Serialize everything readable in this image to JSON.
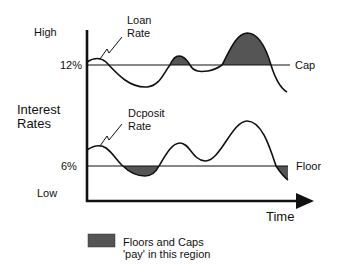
{
  "diagram": {
    "title": "",
    "y_axis": {
      "label_line1": "Interest",
      "label_line2": "Rates",
      "high": "High",
      "low": "Low",
      "tick_12": "12%",
      "tick_6": "6%"
    },
    "x_axis": {
      "label": "Time"
    },
    "lines": {
      "cap": "Cap",
      "floor": "Floor"
    },
    "curves": {
      "loan_line1": "Loan",
      "loan_line2": "Rate",
      "deposit_line1": "Dcposit",
      "deposit_line2": "Rate"
    },
    "legend": {
      "line1": "Floors and Caps",
      "line2": "'pay' in this region",
      "swatch_color": "#555555"
    }
  }
}
